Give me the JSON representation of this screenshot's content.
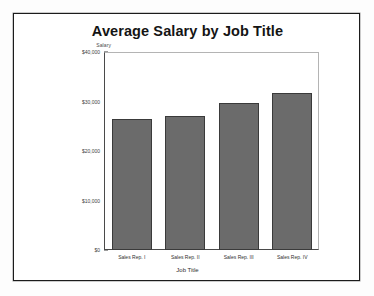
{
  "chart_data": {
    "type": "bar",
    "title": "Average Salary by Job Title",
    "xlabel": "Job Title",
    "ylabel": "Salary",
    "categories": [
      "Sales Rep. I",
      "Sales Rep. II",
      "Sales Rep. III",
      "Sales Rep. IV"
    ],
    "values": [
      26400,
      27100,
      29700,
      31700
    ],
    "ylim": [
      0,
      40000
    ],
    "ytick_values": [
      0,
      10000,
      20000,
      30000,
      40000
    ],
    "ytick_labels": [
      "$0",
      "$10,000",
      "$20,000",
      "$30,000",
      "$40,000"
    ],
    "grid": false,
    "legend": null,
    "minor_ticks_per_interval": 5,
    "bar_color": "#6b6b6b",
    "bar_edge_color": "#3a3a3a"
  },
  "figure": {
    "background_color": "#ffffff",
    "frame_color": "#1b1b1b",
    "axis_color": "#4a4a4a"
  }
}
